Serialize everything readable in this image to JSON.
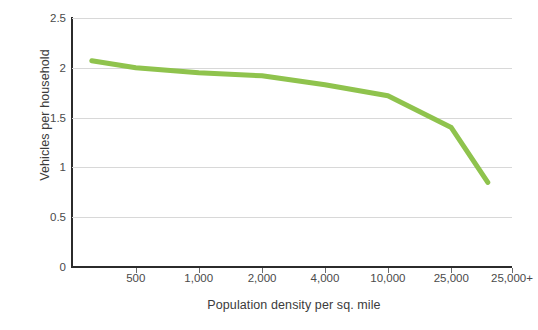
{
  "chart_data": {
    "type": "line",
    "title": "",
    "subtitle": "",
    "xlabel": "Population density per sq. mile",
    "ylabel": "Vehicles per household",
    "categories": [
      "250",
      "500",
      "1,000",
      "2,000",
      "4,000",
      "10,000",
      "25,000",
      "25,000+"
    ],
    "x_tick_labels": [
      "500",
      "1,000",
      "2,000",
      "4,000",
      "10,000",
      "25,000",
      "25,000+"
    ],
    "y_tick_labels": [
      "0",
      "0.5",
      "1",
      "1.5",
      "2",
      "2.5"
    ],
    "y_tick_values": [
      0,
      0.5,
      1,
      1.5,
      2,
      2.5
    ],
    "ylim": [
      0,
      2.5
    ],
    "grid": "horizontal",
    "legend": "none",
    "series": [
      {
        "name": "Vehicles per household",
        "color": "#8fc34d",
        "values": [
          2.07,
          2.0,
          1.95,
          1.92,
          1.83,
          1.72,
          1.4,
          0.85
        ]
      }
    ],
    "points": [
      {
        "x_label": "250",
        "x_frac": 0.045,
        "y": 2.07
      },
      {
        "x_label": "500",
        "x_frac": 0.145,
        "y": 2.0
      },
      {
        "x_label": "1,000",
        "x_frac": 0.288,
        "y": 1.95
      },
      {
        "x_label": "2,000",
        "x_frac": 0.432,
        "y": 1.92
      },
      {
        "x_label": "4,000",
        "x_frac": 0.575,
        "y": 1.83
      },
      {
        "x_label": "10,000",
        "x_frac": 0.718,
        "y": 1.72
      },
      {
        "x_label": "25,000",
        "x_frac": 0.862,
        "y": 1.4
      },
      {
        "x_label": "25,000+",
        "x_frac": 0.945,
        "y": 0.85
      }
    ],
    "colors": {
      "line": "#8fc34d",
      "grid": "#d8d8d8",
      "axis": "#2b2b2b",
      "text": "#3b3b3b",
      "tick_text": "#4a4a4a",
      "background": "#ffffff"
    },
    "x_tick_fracs": [
      0.145,
      0.288,
      0.432,
      0.575,
      0.718,
      0.862,
      1.0
    ]
  }
}
